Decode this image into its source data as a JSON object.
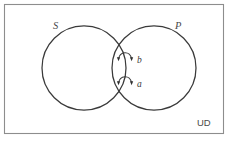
{
  "figure": {
    "type": "venn-diagram",
    "title": "",
    "universe_label": "UD",
    "background_color": "#ffffff",
    "border_color": "#8d8d8d",
    "stroke_color": "#3a3a3a",
    "text_color": "#4a4a4a",
    "sets": [
      {
        "id": "S",
        "label": "S",
        "label_style": "italic",
        "center_x": 84,
        "center_y": 68,
        "radius": 42
      },
      {
        "id": "P",
        "label": "P",
        "label_style": "italic",
        "center_x": 154,
        "center_y": 68,
        "radius": 42
      }
    ],
    "elements": [
      {
        "id": "b",
        "label": "b",
        "label_style": "italic",
        "arrow_from_x": 132,
        "arrow_from_y": 59,
        "arrow_to_x": 117,
        "arrow_to_y": 59,
        "label_x": 137,
        "label_y": 60
      },
      {
        "id": "a",
        "label": "a",
        "label_style": "italic",
        "arrow_from_x": 132,
        "arrow_from_y": 83,
        "arrow_to_x": 117,
        "arrow_to_y": 83,
        "label_x": 137,
        "label_y": 84
      }
    ],
    "universe": {
      "label": "UD",
      "label_style": "plain",
      "label_x": 205,
      "label_y": 123
    },
    "frame": {
      "x": 4,
      "y": 4,
      "width": 220,
      "height": 130
    }
  }
}
